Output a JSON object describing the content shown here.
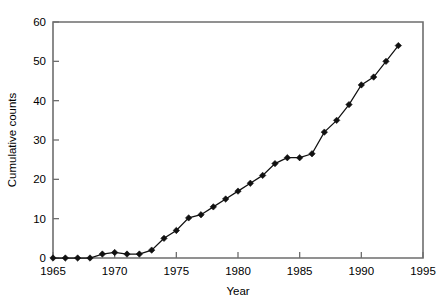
{
  "chart_data": {
    "type": "line",
    "title": "",
    "xlabel": "Year",
    "ylabel": "Cumulative counts",
    "xlim": [
      1965,
      1995
    ],
    "ylim": [
      0,
      60
    ],
    "xticks": [
      1965,
      1970,
      1975,
      1980,
      1985,
      1990,
      1995
    ],
    "yticks": [
      0,
      10,
      20,
      30,
      40,
      50,
      60
    ],
    "grid": false,
    "legend": false,
    "marker": "filled-diamond",
    "line_color": "#111111",
    "marker_color": "#111111",
    "axis_color": "#6e6e6e",
    "x": [
      1965,
      1966,
      1967,
      1968,
      1969,
      1970,
      1971,
      1972,
      1973,
      1974,
      1975,
      1976,
      1977,
      1978,
      1979,
      1980,
      1981,
      1982,
      1983,
      1984,
      1985,
      1986,
      1987,
      1988,
      1989,
      1990,
      1991,
      1992,
      1993
    ],
    "values": [
      0,
      0,
      0,
      0,
      1,
      1.4,
      1,
      1,
      2,
      5,
      7,
      10.2,
      11,
      13,
      15,
      17,
      19,
      21,
      24,
      25.5,
      25.5,
      26.5,
      32,
      35,
      39,
      44,
      46,
      50,
      54
    ],
    "series": [
      {
        "name": "Cumulative counts",
        "values": [
          0,
          0,
          0,
          0,
          1,
          1.4,
          1,
          1,
          2,
          5,
          7,
          10.2,
          11,
          13,
          15,
          17,
          19,
          21,
          24,
          25.5,
          25.5,
          26.5,
          32,
          35,
          39,
          44,
          46,
          50,
          54
        ]
      }
    ]
  },
  "labels": {
    "y_axis_title": "Cumulative counts",
    "x_axis_title": "Year"
  }
}
